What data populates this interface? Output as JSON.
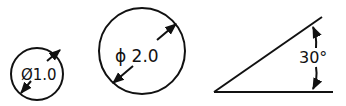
{
  "figure": {
    "small_circle": {
      "label": "Ø1.0",
      "value": 1.0,
      "type": "diameter"
    },
    "large_circle": {
      "label": "ϕ 2.0",
      "value": 2.0,
      "type": "diameter"
    },
    "angle": {
      "label": "30°",
      "value": 30,
      "unit": "degrees"
    },
    "colors": {
      "stroke": "#111111",
      "background": "#ffffff"
    }
  }
}
